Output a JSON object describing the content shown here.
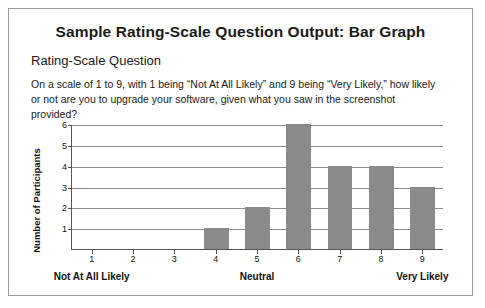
{
  "card": {
    "title": "Sample Rating-Scale Question Output: Bar Graph",
    "subtitle": "Rating-Scale Question",
    "prompt": "On a scale of 1 to 9, with 1 being “Not At All Likely” and 9 being “Very Likely,” how likely or not are you to upgrade your software, given what you saw in the screenshot provided?"
  },
  "chart_data": {
    "type": "bar",
    "title": "Sample Rating-Scale Question Output: Bar Graph",
    "xlabel": "",
    "ylabel": "Number of Participants",
    "categories": [
      "1",
      "2",
      "3",
      "4",
      "5",
      "6",
      "7",
      "8",
      "9"
    ],
    "values": [
      0,
      0,
      0,
      1,
      2,
      6,
      4,
      4,
      3
    ],
    "ylim": [
      0,
      6
    ],
    "yticks": [
      "1",
      "2",
      "3",
      "4",
      "5",
      "6"
    ],
    "grid": true,
    "legend": "none",
    "bar_color": "#8a8a8a",
    "anchors": [
      {
        "label": "Not At All Likely",
        "at": "1"
      },
      {
        "label": "Neutral",
        "at": "5"
      },
      {
        "label": "Very Likely",
        "at": "9"
      }
    ]
  }
}
